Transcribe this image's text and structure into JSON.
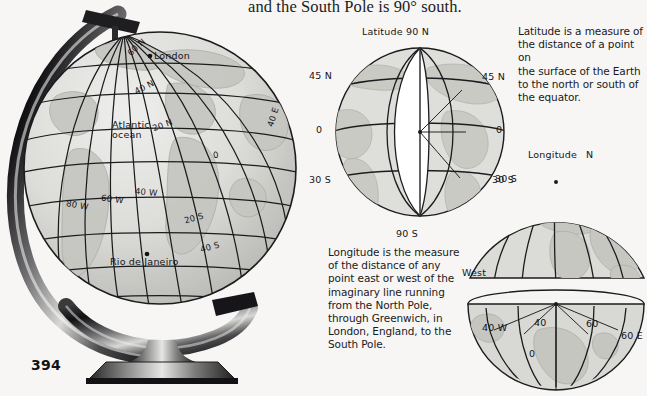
{
  "page": {
    "number": "394",
    "background_color": "#f7f6f4",
    "ink_color": "#18181a"
  },
  "header": {
    "text": "and the South Pole is 90° south."
  },
  "figures": {
    "desk_globe": {
      "name": "desk-globe-on-stand",
      "labels": [
        {
          "text": "60 N",
          "x": 126,
          "y": 42,
          "rot": -42
        },
        {
          "text": "London",
          "x": 152,
          "y": 57,
          "rot": 0
        },
        {
          "text": "40 N",
          "x": 134,
          "y": 82,
          "rot": -28
        },
        {
          "text": "40 E",
          "x": 265,
          "y": 112,
          "rot": -72
        },
        {
          "text": "Atlantic",
          "x": 112,
          "y": 123,
          "rot": 0
        },
        {
          "text": "ocean",
          "x": 112,
          "y": 132,
          "rot": 0
        },
        {
          "text": "20 N",
          "x": 152,
          "y": 124,
          "rot": -20
        },
        {
          "text": "0",
          "x": 213,
          "y": 153,
          "rot": -8
        },
        {
          "text": "80 W",
          "x": 66,
          "y": 204,
          "rot": 10
        },
        {
          "text": "60 W",
          "x": 101,
          "y": 198,
          "rot": 8
        },
        {
          "text": "40 W",
          "x": 135,
          "y": 191,
          "rot": 5
        },
        {
          "text": "20 S",
          "x": 184,
          "y": 217,
          "rot": -16
        },
        {
          "text": "40 S",
          "x": 200,
          "y": 246,
          "rot": -16
        },
        {
          "text": "Rio de Janeiro",
          "x": 112,
          "y": 261,
          "rot": 0
        }
      ]
    },
    "wedge_globe": {
      "name": "latitude-wedge-globe",
      "labels": [
        {
          "text": "Latitude 90 N",
          "x": 362,
          "y": 29,
          "rot": 0
        },
        {
          "text": "45 N",
          "x": 311,
          "y": 73,
          "rot": 0
        },
        {
          "text": "45 N",
          "x": 483,
          "y": 74,
          "rot": 0
        },
        {
          "text": "0",
          "x": 316,
          "y": 128,
          "rot": 0
        },
        {
          "text": "0",
          "x": 496,
          "y": 128,
          "rot": 0
        },
        {
          "text": "30 S",
          "x": 311,
          "y": 178,
          "rot": 0
        },
        {
          "text": "30 S",
          "x": 492,
          "y": 178,
          "rot": 0
        },
        {
          "text": "90 S",
          "x": 396,
          "y": 231,
          "rot": 0
        }
      ]
    },
    "upper_right_globe": {
      "name": "longitude-globe-top",
      "labels": [
        {
          "text": "Longitude",
          "x": 530,
          "y": 152,
          "rot": 0
        },
        {
          "text": "N",
          "x": 587,
          "y": 152,
          "rot": 0
        },
        {
          "text": "30 S",
          "x": 495,
          "y": 176,
          "rot": 0
        },
        {
          "text": "West",
          "x": 463,
          "y": 272,
          "rot": 0
        }
      ]
    },
    "lower_right_globe": {
      "name": "longitude-globe-bottom",
      "labels": [
        {
          "text": "40 W",
          "x": 483,
          "y": 327,
          "rot": 0
        },
        {
          "text": "40",
          "x": 534,
          "y": 321,
          "rot": 0
        },
        {
          "text": "60",
          "x": 586,
          "y": 322,
          "rot": 0
        },
        {
          "text": "60 E",
          "x": 621,
          "y": 334,
          "rot": 0
        },
        {
          "text": "0",
          "x": 529,
          "y": 352,
          "rot": 0
        }
      ]
    }
  },
  "text_blocks": {
    "latitude": {
      "name": "latitude-definition",
      "lines": [
        "Latitude is a measure of",
        "the distance of a point on",
        "the surface of the Earth",
        "to the north or south of",
        "the equator."
      ]
    },
    "longitude": {
      "name": "longitude-definition",
      "lines": [
        "Longitude is the measure",
        "of the distance of any",
        "point east or west of the",
        "imaginary line running",
        "from the North Pole,",
        "through Greenwich, in",
        "London, England, to the",
        "South Pole."
      ]
    }
  },
  "colors": {
    "ocean_fill": "#d9d9d6",
    "land_fill": "#c9c9c5",
    "wedge_fill": "#ffffff",
    "line": "#1c1c1e",
    "stand_dark": "#141416",
    "stand_light": "#cfcfcd"
  }
}
